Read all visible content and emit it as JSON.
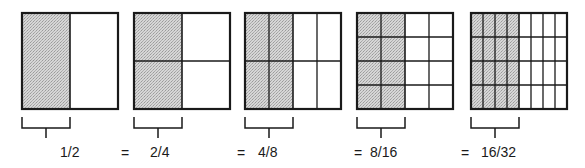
{
  "colors": {
    "stroke": "#1a1a1a",
    "shade": "#c8c8c8",
    "background": "#ffffff"
  },
  "squares": [
    {
      "label": "1/2",
      "cols": 2,
      "rows": 1,
      "shaded_cols": 1,
      "x": 22,
      "y": 13,
      "size": 96
    },
    {
      "label": "2/4",
      "cols": 2,
      "rows": 2,
      "shaded_cols": 1,
      "x": 134,
      "y": 13,
      "size": 96
    },
    {
      "label": "4/8",
      "cols": 4,
      "rows": 2,
      "shaded_cols": 2,
      "x": 245,
      "y": 13,
      "size": 96
    },
    {
      "label": "8/16",
      "cols": 4,
      "rows": 4,
      "shaded_cols": 2,
      "x": 357,
      "y": 13,
      "size": 96
    },
    {
      "label": "16/32",
      "cols": 8,
      "rows": 4,
      "shaded_cols": 4,
      "x": 471,
      "y": 13,
      "size": 96
    }
  ],
  "equals_sign": "=",
  "labels": {
    "f1": "1/2",
    "f2": "2/4",
    "f3": "4/8",
    "f4": "8/16",
    "f5": "16/32",
    "eq": "="
  }
}
